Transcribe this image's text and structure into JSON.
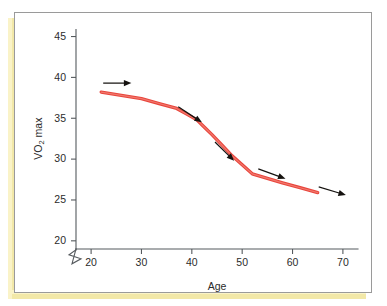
{
  "frame": {
    "border_color": "#9a9a9a",
    "shadow_color": "#f2e8a8",
    "background": "#ffffff"
  },
  "chart_data": {
    "type": "line",
    "title": "",
    "xlabel": "Age",
    "ylabel": "VO2 max",
    "ylabel_parts": {
      "pre": "VO",
      "sub": "2",
      "post": " max"
    },
    "xlim": [
      17,
      73
    ],
    "ylim": [
      19,
      45.8
    ],
    "axis_break": {
      "axis": "y",
      "below": 20,
      "symbol": "zigzag"
    },
    "grid": false,
    "legend": false,
    "xticks": [
      20,
      30,
      40,
      50,
      60,
      70
    ],
    "xtick_labels": [
      "20",
      "30",
      "40",
      "50",
      "60",
      "70"
    ],
    "yticks": [
      20,
      25,
      30,
      35,
      40,
      45
    ],
    "ytick_labels": [
      "20",
      "25",
      "30",
      "35",
      "40",
      "45"
    ],
    "series": [
      {
        "name": "VO2 max decline with age",
        "color": "#e8453c",
        "x": [
          22,
          30,
          37,
          41,
          44,
          48,
          52,
          58,
          65
        ],
        "y": [
          38.2,
          37.4,
          36.2,
          34.8,
          33.0,
          30.4,
          28.2,
          27.1,
          25.9
        ]
      }
    ],
    "annotations": [
      {
        "label": "arrow-1",
        "x1": 22.4,
        "y1": 39.3,
        "x2": 28.0,
        "y2": 39.3
      },
      {
        "label": "arrow-2",
        "x1": 37.3,
        "y1": 36.4,
        "x2": 42.0,
        "y2": 34.5
      },
      {
        "label": "arrow-3",
        "x1": 44.6,
        "y1": 32.1,
        "x2": 48.4,
        "y2": 29.8
      },
      {
        "label": "arrow-4",
        "x1": 53.2,
        "y1": 28.8,
        "x2": 58.6,
        "y2": 27.6
      },
      {
        "label": "arrow-5",
        "x1": 65.2,
        "y1": 26.6,
        "x2": 70.6,
        "y2": 25.6
      }
    ]
  }
}
